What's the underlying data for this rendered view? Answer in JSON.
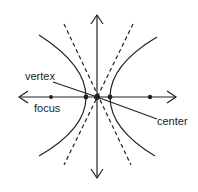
{
  "diagram": {
    "type": "hyperbola",
    "labels": {
      "vertex": "vertex",
      "focus": "focus",
      "center": "center"
    },
    "colors": {
      "stroke": "#222222",
      "background": "#ffffff"
    },
    "points": {
      "center": [
        97,
        97
      ],
      "vertex_left": [
        86,
        97
      ],
      "vertex_right": [
        110,
        97
      ],
      "focus_left": [
        51,
        97
      ],
      "focus_right": [
        150,
        97
      ]
    }
  }
}
